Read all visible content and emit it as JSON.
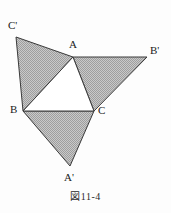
{
  "figure": {
    "caption": "図11-4",
    "background_color": "#fdfdfd",
    "shade_fill_color": "#b5b5b5",
    "stroke_color": "#3a3a3a",
    "label_color": "#1b1b1b"
  },
  "labels": {
    "a": "A",
    "b": "B",
    "c": "C",
    "a_prime": "A'",
    "b_prime": "B'",
    "c_prime": "C'"
  },
  "chart_data": {
    "type": "diagram",
    "title": "図11-4",
    "points": {
      "A": [
        73,
        57
      ],
      "B": [
        23,
        111
      ],
      "C": [
        94,
        111
      ],
      "A_prime": [
        70,
        166
      ],
      "B_prime": [
        147,
        57
      ],
      "C_prime": [
        16,
        37
      ]
    },
    "polygons": [
      {
        "name": "inner-triangle-abc",
        "vertices": [
          "A",
          "B",
          "C"
        ],
        "fill": "none",
        "stroke": "#3a3a3a"
      },
      {
        "name": "shaded-triangle-upper-left",
        "vertices": [
          "C_prime",
          "A",
          "B"
        ],
        "fill": "#b5b5b5",
        "stroke": "#3a3a3a"
      },
      {
        "name": "shaded-triangle-right",
        "vertices": [
          "A",
          "B_prime",
          "C"
        ],
        "fill": "#b5b5b5",
        "stroke": "#3a3a3a"
      },
      {
        "name": "shaded-triangle-bottom",
        "vertices": [
          "B",
          "C",
          "A_prime"
        ],
        "fill": "#b5b5b5",
        "stroke": "#3a3a3a"
      }
    ],
    "label_positions": {
      "A": [
        69,
        39
      ],
      "B": [
        10,
        104
      ],
      "C": [
        98,
        105
      ],
      "A_prime": [
        64,
        172
      ],
      "B_prime": [
        150,
        45
      ],
      "C_prime": [
        8,
        20
      ]
    }
  }
}
